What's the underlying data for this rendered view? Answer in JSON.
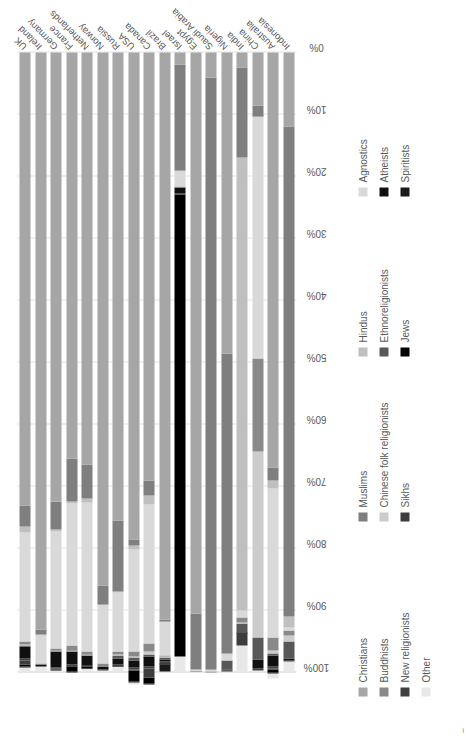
{
  "chart_data": {
    "type": "bar",
    "subtype": "stacked-bar-100-percent-horizontal",
    "orientation": "horizontal",
    "title": "",
    "subtitle": "",
    "xlabel": "",
    "ylabel": "",
    "xlim": [
      0,
      100
    ],
    "xticks": [
      "0%",
      "10%",
      "20%",
      "30%",
      "40%",
      "50%",
      "60%",
      "70%",
      "80%",
      "90%",
      "100%"
    ],
    "grid": true,
    "legend_position": "bottom",
    "rotation_note": "entire figure rendered rotated 90 degrees counter-clockwise",
    "categories": [
      "UK",
      "Ireland",
      "Germany",
      "France",
      "Netherlands",
      "Norway",
      "Russia",
      "USA",
      "Canada",
      "Brazil",
      "Israel",
      "Egypt",
      "Saudi Arabia",
      "Nigeria",
      "India",
      "China",
      "Australia",
      "Indonesia"
    ],
    "series": [
      {
        "name": "Christians",
        "color": "#a6a6a6",
        "values": [
          73.0,
          93.0,
          72.5,
          65.5,
          66.5,
          86.0,
          75.5,
          78.5,
          69.0,
          91.5,
          2.0,
          90.5,
          4.0,
          48.5,
          2.5,
          8.5,
          67.0,
          12.0
        ]
      },
      {
        "name": "Muslims",
        "color": "#7f7f7f",
        "values": [
          3.5,
          0.8,
          4.5,
          7.0,
          5.5,
          3.0,
          11.5,
          1.0,
          2.5,
          0.2,
          17.0,
          9.0,
          95.5,
          48.5,
          14.5,
          1.8,
          2.0,
          79.0
        ]
      },
      {
        "name": "Hindus",
        "color": "#bfbfbf",
        "values": [
          1.0,
          0.2,
          0.2,
          0.2,
          0.6,
          0.1,
          0.1,
          0.6,
          1.4,
          0.1,
          0.1,
          0.0,
          0.2,
          0.1,
          73.0,
          0.1,
          1.4,
          1.8
        ]
      },
      {
        "name": "Agnostics",
        "color": "#d9d9d9",
        "values": [
          17.5,
          4.5,
          19.0,
          23.0,
          24.0,
          9.5,
          9.5,
          16.5,
          22.5,
          5.5,
          2.5,
          0.3,
          0.2,
          1.0,
          1.2,
          39.0,
          24.0,
          0.5
        ]
      },
      {
        "name": "Buddhists",
        "color": "#898989",
        "values": [
          0.5,
          0.2,
          0.3,
          0.8,
          0.5,
          0.4,
          0.5,
          0.8,
          1.2,
          0.2,
          0.2,
          0.0,
          0.1,
          0.0,
          0.8,
          15.0,
          2.0,
          0.8
        ]
      },
      {
        "name": "Chinese folk religionists",
        "color": "#cccccc",
        "values": [
          0.2,
          0.0,
          0.1,
          0.1,
          0.1,
          0.0,
          0.1,
          0.2,
          0.5,
          0.1,
          0.0,
          0.0,
          0.0,
          0.0,
          0.1,
          30.0,
          0.6,
          0.9
        ]
      },
      {
        "name": "Ethnoreligionists",
        "color": "#585858",
        "values": [
          0.1,
          0.0,
          0.1,
          0.1,
          0.1,
          0.0,
          0.6,
          0.4,
          0.3,
          0.3,
          0.0,
          0.0,
          0.0,
          1.5,
          1.5,
          3.5,
          0.2,
          2.8
        ]
      },
      {
        "name": "Atheists",
        "color": "#101010",
        "values": [
          2.0,
          0.4,
          2.5,
          2.0,
          1.5,
          0.6,
          1.0,
          1.2,
          1.6,
          0.4,
          1.0,
          0.1,
          0.0,
          0.1,
          0.1,
          1.5,
          1.8,
          0.2
        ]
      },
      {
        "name": "New religionists",
        "color": "#404040",
        "values": [
          0.3,
          0.0,
          0.2,
          0.3,
          0.2,
          0.1,
          0.2,
          0.3,
          0.4,
          0.4,
          0.1,
          0.0,
          0.0,
          0.1,
          0.1,
          0.3,
          0.4,
          0.2
        ]
      },
      {
        "name": "Sikhs",
        "color": "#3d3d3d",
        "values": [
          0.6,
          0.0,
          0.1,
          0.1,
          0.1,
          0.0,
          0.0,
          0.2,
          1.4,
          0.0,
          0.0,
          0.0,
          0.0,
          0.0,
          1.9,
          0.0,
          0.1,
          0.0
        ]
      },
      {
        "name": "Jews",
        "color": "#000000",
        "values": [
          0.4,
          0.0,
          0.2,
          0.8,
          0.2,
          0.0,
          0.1,
          1.8,
          1.0,
          0.1,
          74.5,
          0.0,
          0.0,
          0.0,
          0.0,
          0.0,
          0.5,
          0.0
        ]
      },
      {
        "name": "Spiritists",
        "color": "#1a1a1a",
        "values": [
          0.1,
          0.0,
          0.0,
          0.1,
          0.1,
          0.0,
          0.0,
          0.1,
          0.1,
          1.0,
          0.0,
          0.0,
          0.0,
          0.0,
          0.0,
          0.0,
          0.1,
          0.0
        ]
      },
      {
        "name": "Other",
        "color": "#e8e8e8",
        "values": [
          0.8,
          0.9,
          0.3,
          0.0,
          0.6,
          0.3,
          0.9,
          0.4,
          0.1,
          0.2,
          2.6,
          0.1,
          0.0,
          0.2,
          4.3,
          0.3,
          0.9,
          1.8
        ]
      }
    ]
  },
  "legend": {
    "columns": [
      {
        "items": [
          {
            "label": "Christians",
            "color": "#a6a6a6"
          },
          {
            "label": "Buddhists",
            "color": "#898989"
          },
          {
            "label": "New religionists",
            "color": "#404040"
          },
          {
            "label": "Other",
            "color": "#e8e8e8"
          }
        ]
      },
      {
        "items": [
          {
            "label": "Muslims",
            "color": "#7f7f7f"
          },
          {
            "label": "Chinese folk religionists",
            "color": "#cccccc"
          },
          {
            "label": "Sikhs",
            "color": "#3d3d3d"
          }
        ]
      },
      {
        "items": [
          {
            "label": "Hindus",
            "color": "#bfbfbf"
          },
          {
            "label": "Ethnoreligionists",
            "color": "#585858"
          },
          {
            "label": "Jews",
            "color": "#000000"
          }
        ]
      },
      {
        "items": [
          {
            "label": "Agnostics",
            "color": "#d9d9d9"
          },
          {
            "label": "Atheists",
            "color": "#101010"
          },
          {
            "label": "Spiritists",
            "color": "#1a1a1a"
          }
        ]
      }
    ]
  },
  "corner_mark": "i"
}
